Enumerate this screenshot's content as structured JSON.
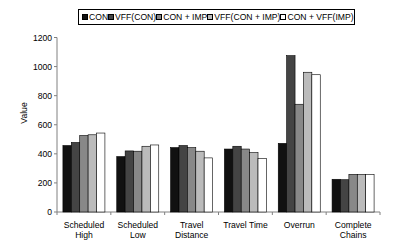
{
  "chart_data": {
    "type": "bar",
    "title": "",
    "xlabel": "",
    "ylabel": "Value",
    "ylim": [
      0,
      1200
    ],
    "yticks": [
      0,
      200,
      400,
      600,
      800,
      1000,
      1200
    ],
    "grid": false,
    "legend_position": "top",
    "categories": [
      "Scheduled High",
      "Scheduled Low",
      "Travel Distance",
      "Travel Time",
      "Overrun",
      "Complete Chains"
    ],
    "category_lines": [
      [
        "Scheduled",
        "High"
      ],
      [
        "Scheduled",
        "Low"
      ],
      [
        "Travel",
        "Distance"
      ],
      [
        "Travel Time",
        ""
      ],
      [
        "Overrun",
        ""
      ],
      [
        "Complete",
        "Chains"
      ]
    ],
    "series": [
      {
        "name": "CON",
        "color": "#111111",
        "values": [
          457,
          381,
          443,
          433,
          472,
          225
        ]
      },
      {
        "name": "VFF(CON)",
        "color": "#444444",
        "values": [
          478,
          420,
          457,
          452,
          1075,
          222
        ]
      },
      {
        "name": "CON + IMP",
        "color": "#888888",
        "values": [
          526,
          418,
          443,
          433,
          741,
          259
        ]
      },
      {
        "name": "VFF(CON + IMP)",
        "color": "#bbbbbb",
        "values": [
          531,
          452,
          418,
          408,
          961,
          259
        ]
      },
      {
        "name": "CON + VFF(IMP)",
        "color": "#ffffff",
        "values": [
          543,
          461,
          372,
          369,
          944,
          259
        ]
      }
    ]
  }
}
